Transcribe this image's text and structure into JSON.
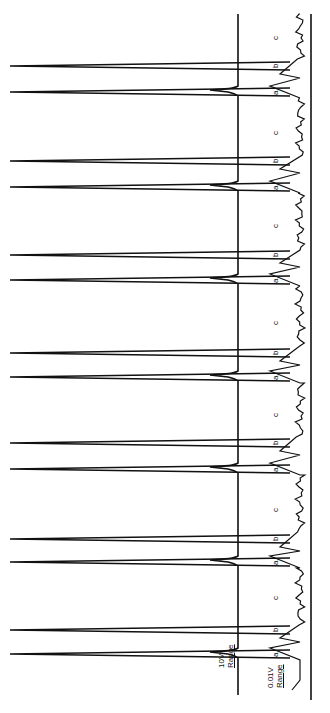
{
  "chart_data": {
    "type": "line",
    "title": "",
    "series": [
      {
        "name": "10V Range",
        "description": "Large off-scale spikes at peaks a and b for each injection"
      },
      {
        "name": "0.01V Range",
        "description": "High-sensitivity trace showing small peaks a, b, c"
      }
    ],
    "peak_labels": [
      "a",
      "b",
      "c"
    ],
    "injections": 7,
    "spike_positions_px": [
      {
        "b": 66,
        "a": 92,
        "c": 40
      },
      {
        "b": 161,
        "a": 187,
        "c": 135
      },
      {
        "b": 255,
        "a": 280,
        "c": 228
      },
      {
        "b": 353,
        "a": 377,
        "c": 325
      },
      {
        "b": 443,
        "a": 469,
        "c": 417
      },
      {
        "b": 539,
        "a": 562,
        "c": 512
      },
      {
        "b": 630,
        "a": 654,
        "c": 600
      }
    ],
    "axis_labels": {
      "range1": "10V Range",
      "range2": "0.01V Range"
    }
  },
  "labels": {
    "range1_line1": "10V",
    "range1_line2": "Range",
    "range2_line1": "0.01V",
    "range2_line2": "Range",
    "peak_a": "a",
    "peak_b": "b",
    "peak_c": "c"
  }
}
